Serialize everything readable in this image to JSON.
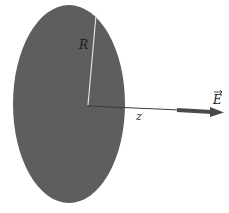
{
  "diagram": {
    "disk": {
      "fill": "#5e5e5e",
      "label": "R"
    },
    "axis": {
      "label": "z",
      "color": "#3a3a3a"
    },
    "field_vector": {
      "label": "E",
      "has_arrow_accent": true,
      "color": "#4a4a4a"
    },
    "radius_line_color": "#e0e0e0"
  }
}
